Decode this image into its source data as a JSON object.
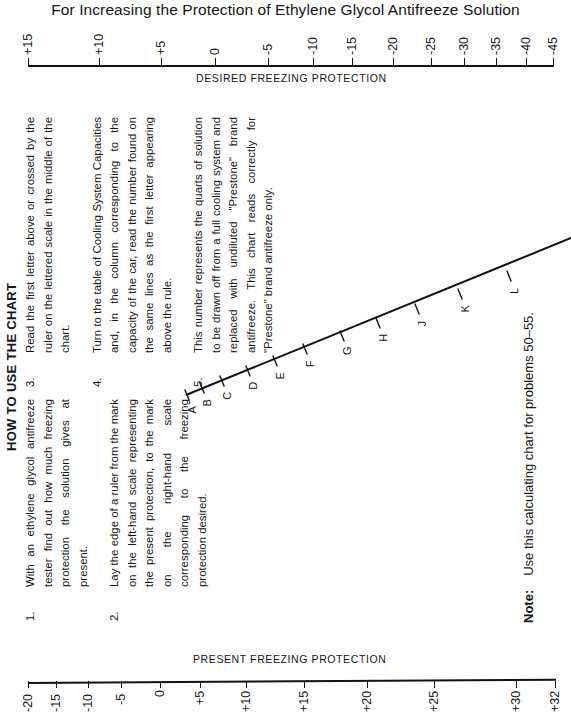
{
  "title": "For Increasing the Protection of Ethylene Glycol Antifreeze Solution",
  "heading": "HOW TO USE THE CHART",
  "instructions": [
    {
      "num": "1.",
      "text": "With an ethylene glycol antifreeze tester find out how much freezing protection the solution gives at present."
    },
    {
      "num": "2.",
      "text": "Lay the edge of a ruler from the mark on the left-hand scale representing the present protection, to the mark on the right-hand scale corresponding to the freezing protection desired."
    },
    {
      "num": "3.",
      "text": "Read the first letter above or crossed by the ruler on the lettered scale in the middle of the chart."
    },
    {
      "num": "4.",
      "text": "Turn to the table of Cooling System Capacities and, in the column corresponding to the capacity of the car, read the number found on the same lines as the first letter appearing above the rule."
    },
    {
      "num": "5.",
      "text": "This number represents the quarts of solution to be drawn off from a full cooling system and replaced with undiluted \"Prestone\" brand antifreeze. This chart reads correctly for \"Prestone\" brand antifreeze only."
    }
  ],
  "note": {
    "label": "Note:",
    "text": "Use this calculating chart for problems 50–55."
  },
  "chart_data": {
    "type": "nomogram",
    "title": "For Increasing the Protection of Ethylene Glycol Antifreeze Solution",
    "scales": [
      {
        "name": "desired",
        "label": "DESIRED FREEZING PROTECTION",
        "ticks": [
          "+15",
          "+10",
          "+5",
          "0",
          "-5",
          "-10",
          "-15",
          "-20",
          "-25",
          "-30",
          "-35",
          "-40",
          "-45"
        ],
        "tick_x": [
          28,
          99,
          161,
          215,
          268,
          313,
          352,
          393,
          431,
          464,
          496,
          526,
          553
        ]
      },
      {
        "name": "present",
        "label": "PRESENT FREEZING PROTECTION",
        "ticks": [
          "-20",
          "-15",
          "-10",
          "-5",
          "0",
          "+5",
          "+10",
          "+15",
          "+20",
          "+25",
          "+30",
          "+32"
        ],
        "tick_x": [
          28,
          56,
          88,
          121,
          160,
          200,
          246,
          304,
          367,
          434,
          516,
          555
        ]
      },
      {
        "name": "lettered",
        "label": "",
        "ticks": [
          "A",
          "B",
          "C",
          "D",
          "E",
          "F",
          "G",
          "H",
          "J",
          "K",
          "L"
        ]
      }
    ]
  }
}
